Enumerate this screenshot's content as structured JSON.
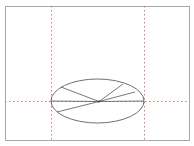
{
  "app": {
    "title": "3D Wireframe Viewport",
    "type": "cad-wireframe-canvas"
  },
  "canvas": {
    "width": 194,
    "height": 146,
    "background_color": "#ffffff",
    "border_color": "#a8a8a8",
    "border_rect": {
      "x": 5,
      "y": 6,
      "width": 184,
      "height": 134
    }
  },
  "guides": {
    "label": "construction guides",
    "color": "#c0392b",
    "style": "dotted",
    "vertical": [
      {
        "name": "left-guide",
        "x": 51,
        "y1": 6,
        "y2": 140
      },
      {
        "name": "right-guide",
        "x": 144,
        "y1": 6,
        "y2": 140
      }
    ],
    "horizontal": [
      {
        "name": "center-guide",
        "y": 101,
        "x1": 5,
        "x2": 189
      }
    ]
  },
  "geometry": {
    "label": "cone wireframe",
    "stroke_color": "#555555",
    "ellipse": {
      "name": "base-ellipse",
      "cx": 97.5,
      "cy": 101,
      "rx": 46.5,
      "ry": 22
    },
    "apex": {
      "name": "apex-vertex",
      "x": 99,
      "y": 101.5
    },
    "radial_lines": [
      {
        "name": "radial-line-upper-left",
        "x2": 61,
        "y2": 87
      },
      {
        "name": "radial-line-upper-right",
        "x2": 123,
        "y2": 84
      },
      {
        "name": "radial-line-right",
        "x2": 135,
        "y2": 92
      },
      {
        "name": "radial-line-lower-left",
        "x2": 57,
        "y2": 112
      },
      {
        "name": "radial-line-left-axis",
        "x2": 51,
        "y2": 101
      },
      {
        "name": "radial-line-right-axis",
        "x2": 144,
        "y2": 101
      }
    ]
  }
}
